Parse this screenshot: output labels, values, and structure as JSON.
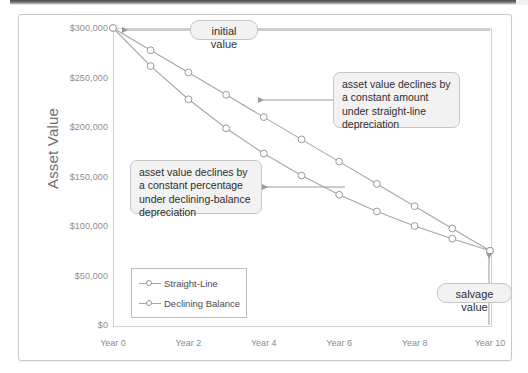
{
  "chart_data": {
    "type": "line",
    "title": "",
    "xlabel": "",
    "ylabel": "Asset Value",
    "x": [
      0,
      1,
      2,
      3,
      4,
      5,
      6,
      7,
      8,
      9,
      10
    ],
    "xtick_labels": [
      "Year 0",
      "Year 2",
      "Year 4",
      "Year 6",
      "Year 8",
      "Year 10"
    ],
    "xtick_values": [
      0,
      2,
      4,
      6,
      8,
      10
    ],
    "ytick_labels": [
      "$0",
      "$50,000",
      "$100,000",
      "$150,000",
      "$200,000",
      "$250,000",
      "$300,000"
    ],
    "ytick_values": [
      0,
      50000,
      100000,
      150000,
      200000,
      250000,
      300000
    ],
    "ylim": [
      0,
      300000
    ],
    "xlim": [
      0,
      10
    ],
    "grid": false,
    "legend_position": "inside-lower-left",
    "series": [
      {
        "name": "Straight-Line",
        "values": [
          300000,
          277500,
          255000,
          232500,
          210000,
          187500,
          165000,
          142500,
          120000,
          97500,
          75000
        ]
      },
      {
        "name": "Declining Balance",
        "values": [
          300000,
          261500,
          228000,
          198700,
          173200,
          151000,
          131600,
          114700,
          100000,
          87200,
          75000
        ]
      }
    ],
    "annotations": [
      {
        "name": "initial-value",
        "text": "initial value",
        "points_to": "Year 0 at $300,000"
      },
      {
        "name": "straight-line-note",
        "text": "asset value declines by a constant amount under straight-line depreciation",
        "points_to": "Straight-Line series"
      },
      {
        "name": "declining-balance-note",
        "text": "asset value declines by a constant percentage under declining-balance depreciation",
        "points_to": "Declining Balance series"
      },
      {
        "name": "salvage-value",
        "text": "salvage value",
        "points_to": "Year 10 at $75,000"
      }
    ],
    "colors": {
      "series_line": "#a6a6a6",
      "marker_fill": "#ffffff",
      "marker_stroke": "#9a9a9a",
      "callout_fill": "#f2f2f2",
      "callout_border": "#c6c6c6",
      "axis": "#d2d2d2",
      "tick_text": "#8d8d8d",
      "axis_title": "#6f6f6f",
      "annotation_text": "#2e2e2e"
    }
  }
}
